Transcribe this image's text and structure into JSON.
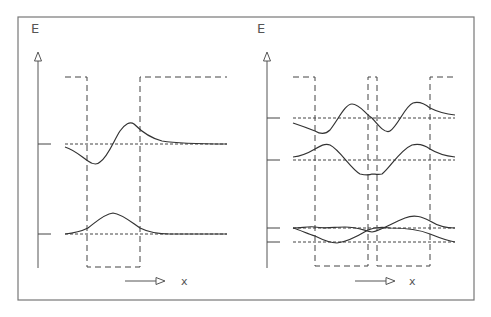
{
  "figure": {
    "frame": {
      "x": 18,
      "y": 17,
      "w": 456,
      "h": 283
    },
    "colors": {
      "line": "#333333",
      "frame": "#777777",
      "dash": "#444444",
      "text": "#555555"
    },
    "panels": [
      {
        "id": "single-well",
        "title": "Single quantum well",
        "axis_label_y": "E",
        "axis_label_x": "x",
        "energy_axis": {
          "x": 38,
          "top": 50,
          "bottom": 268
        },
        "well": {
          "top": 77,
          "bottom": 267,
          "start": 65,
          "end": 227,
          "walls": [
            87,
            140
          ]
        },
        "levels": [
          144,
          234
        ],
        "x_arrow": {
          "y": 281,
          "x1": 125,
          "x2": 165,
          "label_x": 184
        }
      },
      {
        "id": "double-well",
        "title": "Coupled double quantum well",
        "axis_label_y": "E",
        "axis_label_x": "x",
        "energy_axis": {
          "x": 267,
          "top": 50,
          "bottom": 268
        },
        "well": {
          "top": 77,
          "bottom": 266,
          "start": 293,
          "end": 455,
          "walls": [
            315,
            368,
            377,
            430
          ]
        },
        "levels": [
          118,
          160,
          228,
          242
        ],
        "x_arrow": {
          "y": 281,
          "x1": 355,
          "x2": 395,
          "label_x": 412
        }
      }
    ]
  },
  "labels": {
    "left_E": "E",
    "left_x": "x",
    "right_E": "E",
    "right_x": "x"
  }
}
